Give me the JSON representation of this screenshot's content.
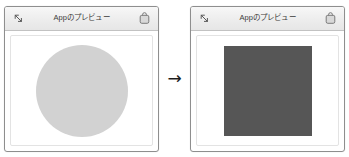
{
  "figure": {
    "transition_arrow": "→"
  },
  "panels": [
    {
      "title": "Appのプレビュー",
      "collapse_icon": "collapse-diagonal-arrow-icon",
      "app_icon": "app-bag-icon",
      "shape": {
        "kind": "circle",
        "color": "#d2d2d2"
      }
    },
    {
      "title": "Appのプレビュー",
      "collapse_icon": "collapse-diagonal-arrow-icon",
      "app_icon": "app-bag-icon",
      "shape": {
        "kind": "square",
        "color": "#565656"
      }
    }
  ],
  "colors": {
    "panel_border": "#8e8e8e",
    "titlebar_bg": "#ededed",
    "titlebar_border": "#c2c2c2",
    "canvas_bg": "#ffffff",
    "title_text": "#3b3b3b",
    "arrow": "#1c1c1c"
  }
}
